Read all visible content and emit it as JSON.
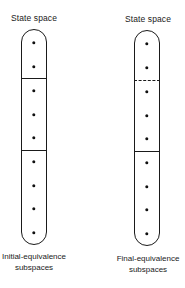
{
  "diagram": {
    "type": "state-space-partition",
    "columns": [
      {
        "id": "initial",
        "title": "State space",
        "caption_line1": "Initial-equivalence",
        "caption_line2": "subspaces",
        "state_count": 9,
        "partitions": [
          2,
          3,
          4
        ],
        "dividers": [
          {
            "after_state": 2,
            "style": "solid"
          },
          {
            "after_state": 5,
            "style": "solid"
          }
        ]
      },
      {
        "id": "final",
        "title": "State space",
        "caption_line1": "Final-equivalence",
        "caption_line2": "subspaces",
        "state_count": 9,
        "partitions": [
          2,
          3,
          4
        ],
        "dividers": [
          {
            "after_state": 2,
            "style": "dashed"
          },
          {
            "after_state": 5,
            "style": "solid"
          }
        ]
      }
    ],
    "colors": {
      "stroke": "#1a1a1a",
      "dot": "#111111",
      "background": "#ffffff"
    }
  }
}
